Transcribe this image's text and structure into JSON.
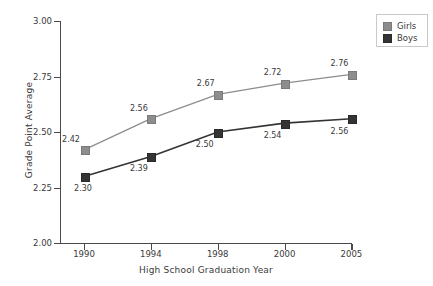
{
  "chart_data": {
    "type": "line",
    "title": "",
    "xlabel": "High School Graduation Year",
    "ylabel": "Grade Point Average",
    "categories": [
      "1990",
      "1994",
      "1998",
      "2000",
      "2005"
    ],
    "xtick_labels": [
      "1990",
      "1994",
      "1998",
      "2000",
      "2005"
    ],
    "ytick_labels": [
      "2.00",
      "2.25",
      "2.50",
      "2.75",
      "3.00"
    ],
    "yticks": [
      2.0,
      2.25,
      2.5,
      2.75,
      3.0
    ],
    "ylim": [
      2.0,
      3.0
    ],
    "grid": false,
    "legend_position": "upper-right-outside",
    "series": [
      {
        "name": "Girls",
        "color": "#8d8d8d",
        "values": [
          2.42,
          2.56,
          2.67,
          2.72,
          2.76
        ],
        "data_labels": [
          "2.42",
          "2.56",
          "2.67",
          "2.72",
          "2.76"
        ]
      },
      {
        "name": "Boys",
        "color": "#343434",
        "values": [
          2.3,
          2.39,
          2.5,
          2.54,
          2.56
        ],
        "data_labels": [
          "2.30",
          "2.39",
          "2.50",
          "2.54",
          "2.56"
        ]
      }
    ]
  },
  "legend": {
    "items": [
      {
        "label": "Girls",
        "color": "#8d8d8d"
      },
      {
        "label": "Boys",
        "color": "#343434"
      }
    ]
  },
  "axes": {
    "x_title": "High School Graduation Year",
    "y_title": "Grade Point Average"
  }
}
